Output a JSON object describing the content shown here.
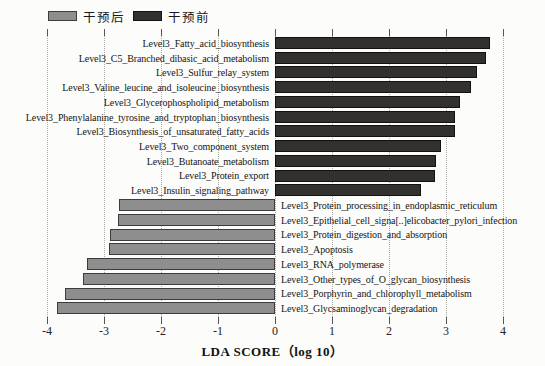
{
  "colors": {
    "background": "#fcfcfa",
    "grid": "#a9a9a5",
    "tick": "#555555",
    "text": "#1a1a1a"
  },
  "chart_data": {
    "type": "bar",
    "orientation": "horizontal",
    "title": "",
    "xlabel": "LDA SCORE（log 10）",
    "xlim": [
      -4,
      4
    ],
    "xticks": [
      -4,
      -3,
      -2,
      -1,
      0,
      1,
      2,
      3,
      4
    ],
    "grid": "dotted-vertical",
    "legend_position": "top-left",
    "legend": [
      {
        "id": "post",
        "label": "干预后",
        "fill": "#8e8e8e",
        "border": "#3c3c3c"
      },
      {
        "id": "pre",
        "label": "干预前",
        "fill": "#333030",
        "border": "#121212"
      }
    ],
    "bars": [
      {
        "label": "Level3_Fatty_acid_biosynthesis",
        "value": 3.78,
        "group": "pre"
      },
      {
        "label": "Level3_C5_Branched_dibasic_acid_metabolism",
        "value": 3.7,
        "group": "pre"
      },
      {
        "label": "Level3_Sulfur_relay_system",
        "value": 3.55,
        "group": "pre"
      },
      {
        "label": "Level3_Valine_leucine_and_isoleucine_biosynthesis",
        "value": 3.44,
        "group": "pre"
      },
      {
        "label": "Level3_Glycerophospholipid_metabolism",
        "value": 3.25,
        "group": "pre"
      },
      {
        "label": "Level3_Phenylalanine_tyrosine_and_tryptophan_biosynthesis",
        "value": 3.16,
        "group": "pre"
      },
      {
        "label": "Level3_Biosynthesis_of_unsaturated_fatty_acids",
        "value": 3.15,
        "group": "pre"
      },
      {
        "label": "Level3_Two_component_system",
        "value": 2.91,
        "group": "pre"
      },
      {
        "label": "Level3_Butanoate_metabolism",
        "value": 2.82,
        "group": "pre"
      },
      {
        "label": "Level3_Protein_export",
        "value": 2.8,
        "group": "pre"
      },
      {
        "label": "Level3_Insulin_signaling_pathway",
        "value": 2.57,
        "group": "pre"
      },
      {
        "label": "Level3_Protein_processing_in_endoplasmic_reticulum",
        "value": -2.73,
        "group": "post"
      },
      {
        "label": "Level3_Epithelial_cell_signa[..]elicobacter_pylori_infection",
        "value": -2.75,
        "group": "post"
      },
      {
        "label": "Level3_Protein_digestion_and_absorption",
        "value": -2.89,
        "group": "post"
      },
      {
        "label": "Level3_Apoptosis",
        "value": -2.92,
        "group": "post"
      },
      {
        "label": "Level3_RNA_polymerase",
        "value": -3.29,
        "group": "post"
      },
      {
        "label": "Level3_Other_types_of_O_glycan_biosynthesis",
        "value": -3.36,
        "group": "post"
      },
      {
        "label": "Level3_Porphyrin_and_chlorophyll_metabolism",
        "value": -3.69,
        "group": "post"
      },
      {
        "label": "Level3_Glycsaminoglycan_degradation",
        "value": -3.83,
        "group": "post"
      }
    ]
  }
}
